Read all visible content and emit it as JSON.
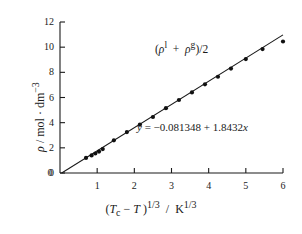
{
  "figure": {
    "name": "rectilinear-diameter-plot",
    "background": "#ffffff",
    "ink_color": "#1a1a1a"
  },
  "axes": {
    "x": {
      "title_html": "(<i>T</i><sub>c</sub> &minus; <i>T</i> )<sup>1/3</sup> &nbsp;/ &nbsp;K<sup>1/3</sup>",
      "title_plain": "(Tc - T)^1/3 / K^1/3",
      "min": 0,
      "max": 6,
      "ticks": [
        0,
        1,
        2,
        3,
        4,
        5,
        6
      ],
      "tick_labels": [
        "0",
        "1",
        "2",
        "3",
        "4",
        "5",
        "6"
      ]
    },
    "y": {
      "title_html": "<i>&rho;</i>&nbsp;/ mol &middot; dm<sup>&minus;3</sup>",
      "title_plain": "rho / mol . dm^-3",
      "min": 0,
      "max": 12,
      "ticks": [
        0,
        2,
        4,
        6,
        8,
        10,
        12
      ],
      "tick_labels": [
        "0",
        "2",
        "4",
        "6",
        "8",
        "10",
        "12"
      ]
    }
  },
  "annotations": {
    "series_label_html": "(<i>&rho;</i><sup>l</sup> &nbsp;+ &nbsp;<i>&rho;</i><sup>g</sup>)/2",
    "series_label_plain": "(rho^l + rho^g)/2",
    "equation_html": "<i>y</i> = &minus;0.081348 + 1.8432<i>x</i>",
    "equation_plain": "y = -0.081348 + 1.8432x"
  },
  "chart_data": {
    "type": "scatter",
    "title": "",
    "xlabel": "(Tc - T)^1/3 / K^1/3",
    "ylabel": "rho / mol . dm^-3",
    "xlim": [
      0,
      6
    ],
    "ylim": [
      0,
      12
    ],
    "grid": false,
    "legend": "none",
    "series": [
      {
        "name": "(rho^l + rho^g)/2",
        "marker": "filled-circle",
        "marker_color": "#111111",
        "x": [
          0.7,
          0.85,
          0.95,
          1.05,
          1.15,
          1.45,
          1.8,
          2.15,
          2.5,
          2.85,
          3.2,
          3.55,
          3.9,
          4.25,
          4.6,
          5.0,
          5.45,
          6.0
        ],
        "y": [
          1.2,
          1.4,
          1.55,
          1.7,
          1.9,
          2.6,
          3.25,
          3.85,
          4.45,
          5.15,
          5.8,
          6.4,
          7.05,
          7.65,
          8.3,
          9.05,
          9.85,
          10.45
        ]
      }
    ],
    "fit": {
      "type": "linear",
      "equation": "y = -0.081348 + 1.8432x",
      "intercept": -0.081348,
      "slope": 1.8432,
      "x_start": 0.045,
      "x_end": 6.0,
      "color": "#1a1a1a"
    }
  }
}
